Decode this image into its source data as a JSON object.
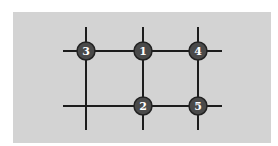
{
  "diagram": {
    "type": "grid-network",
    "background": "#d3d3d3",
    "line_color": "#1c1c1c",
    "node_fill": "#4a4a4a",
    "node_text_color": "#ffffff",
    "nodes": [
      {
        "label": "3",
        "x": 86,
        "y": 51
      },
      {
        "label": "1",
        "x": 143,
        "y": 51
      },
      {
        "label": "4",
        "x": 198,
        "y": 51
      },
      {
        "label": "2",
        "x": 143,
        "y": 106
      },
      {
        "label": "5",
        "x": 198,
        "y": 106
      }
    ]
  }
}
